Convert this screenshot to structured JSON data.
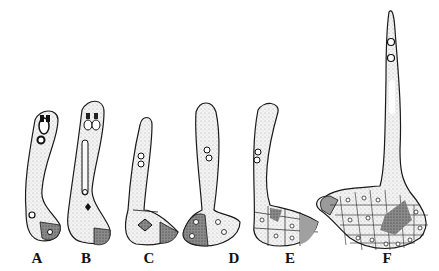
{
  "figure": {
    "style": "stippled ink line drawing",
    "ink_color": "#1a1a1a",
    "stipple_color": "#bdbdbd",
    "dark_cell_color": "#6a6a6a",
    "panels": [
      {
        "id": "A",
        "label": "A",
        "label_x": 37
      },
      {
        "id": "B",
        "label": "B",
        "label_x": 86
      },
      {
        "id": "C",
        "label": "C",
        "label_x": 149
      },
      {
        "id": "D",
        "label": "D",
        "label_x": 234
      },
      {
        "id": "E",
        "label": "E",
        "label_x": 290
      },
      {
        "id": "F",
        "label": "F",
        "label_x": 387
      }
    ]
  }
}
